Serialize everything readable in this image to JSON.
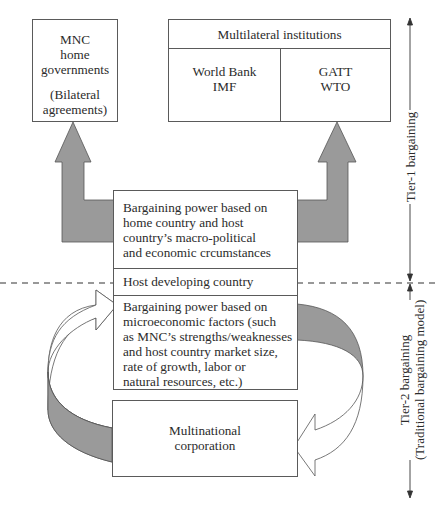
{
  "diagram": {
    "mnc_home": {
      "title_lines": [
        "MNC",
        "home",
        "governments"
      ],
      "note_lines": [
        "(Bilateral",
        "agreements)"
      ]
    },
    "multilateral": {
      "header": "Multilateral institutions",
      "left_lines": [
        "World Bank",
        "IMF"
      ],
      "right_lines": [
        "GATT",
        "WTO"
      ]
    },
    "host_box": {
      "macro_lines": [
        "Bargaining power based on",
        "home country and host",
        "country’s macro-political",
        "and economic crcumstances"
      ],
      "host_label": "Host developing country",
      "micro_lines": [
        "Bargaining power based on",
        "microeconomic factors (such",
        "as MNC’s strengths/weaknesses",
        "and host country market size,",
        "rate of growth, labor or",
        "natural resources, etc.)"
      ]
    },
    "mnc_corp": {
      "lines": [
        "Multinational",
        "corporation"
      ]
    },
    "axis": {
      "tier1_label": "Tier-1 bargaining",
      "tier2_label_line1": "Tier-2 bargaining",
      "tier2_label_line2": "(Traditional bargaining model)"
    },
    "colors": {
      "arrow_fill": "#9a9a9a",
      "line": "#4a4a4a",
      "text": "#2b2b2b"
    }
  }
}
